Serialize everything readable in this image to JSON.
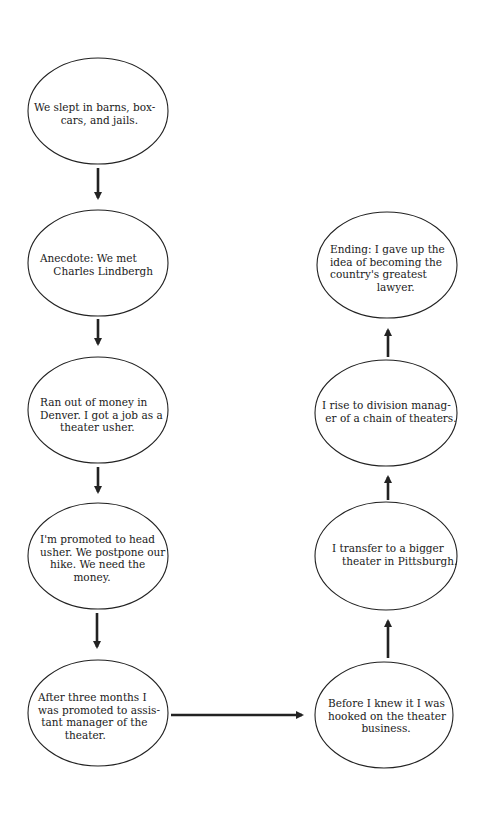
{
  "diagram": {
    "type": "flowchart",
    "style": {
      "stroke": "#222222",
      "background": "#ffffff"
    },
    "nodes": [
      {
        "id": "n1",
        "shape": "ellipse",
        "text": "We slept in barns, box-\n        cars, and jails."
      },
      {
        "id": "n2",
        "shape": "ellipse",
        "text": "Anecdote: We met\n    Charles Lindbergh"
      },
      {
        "id": "n3",
        "shape": "ellipse",
        "text": "Ran out of money in\nDenver. I got a job as a\n      theater usher."
      },
      {
        "id": "n4",
        "shape": "ellipse",
        "text": "I'm promoted to head\nusher. We postpone our\n   hike. We need the\n          money."
      },
      {
        "id": "n5",
        "shape": "ellipse",
        "text": "After three months I\nwas promoted to assis-\n tant manager of the\n        theater."
      },
      {
        "id": "n6",
        "shape": "ellipse",
        "text": "Before I knew it I was\nhooked on the theater\n          business."
      },
      {
        "id": "n7",
        "shape": "ellipse",
        "text": "I transfer to a bigger\n   theater in Pittsburgh."
      },
      {
        "id": "n8",
        "shape": "ellipse",
        "text": "I rise to division manag-\n er of a chain of theaters."
      },
      {
        "id": "n9",
        "shape": "ellipse",
        "text": "Ending: I gave up the\nidea of becoming the\ncountry's greatest\n              lawyer."
      }
    ],
    "edges": [
      {
        "from": "n1",
        "to": "n2",
        "direction": "down"
      },
      {
        "from": "n2",
        "to": "n3",
        "direction": "down"
      },
      {
        "from": "n3",
        "to": "n4",
        "direction": "down"
      },
      {
        "from": "n4",
        "to": "n5",
        "direction": "down"
      },
      {
        "from": "n5",
        "to": "n6",
        "direction": "right"
      },
      {
        "from": "n6",
        "to": "n7",
        "direction": "up"
      },
      {
        "from": "n7",
        "to": "n8",
        "direction": "up"
      },
      {
        "from": "n8",
        "to": "n9",
        "direction": "up"
      }
    ]
  }
}
